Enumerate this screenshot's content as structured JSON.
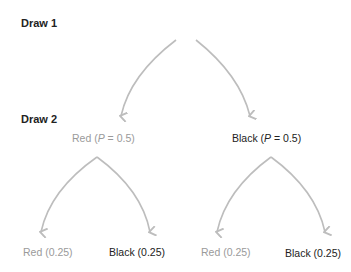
{
  "levels": [
    {
      "label": "Draw 1"
    },
    {
      "label": "Draw 2"
    }
  ],
  "draw2": {
    "red": {
      "prefix": "Red (",
      "p": "P",
      "suffix": " = 0.5)"
    },
    "black": {
      "prefix": "Black (",
      "p": "P",
      "suffix": " = 0.5)"
    }
  },
  "leaves": [
    {
      "label": "Red (0.25)",
      "color": "red"
    },
    {
      "label": "Black (0.25)",
      "color": "black"
    },
    {
      "label": "Red (0.25)",
      "color": "red"
    },
    {
      "label": "Black (0.25)",
      "color": "black"
    }
  ],
  "colors": {
    "arrow": "#bdbdbd",
    "red_text": "#9a9a9a",
    "black_text": "#222222"
  }
}
